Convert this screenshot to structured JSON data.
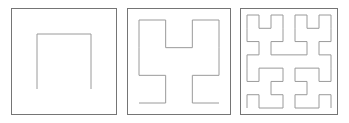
{
  "figure": {
    "background_color": "#ffffff",
    "width": 349,
    "height": 123,
    "panel_count": 3
  },
  "style": {
    "panel_border_color": "#757575",
    "panel_border_width": 1,
    "panel_fill_color": "#ffffff",
    "curve_stroke_color": "#9a9a9a",
    "curve_stroke_width": 1
  },
  "panels": [
    {
      "name": "hilbert-order-1",
      "label": "Order 1",
      "order": 1,
      "segments": 3,
      "vertices": 4,
      "x": 11,
      "y": 8,
      "width": 106,
      "height": 107,
      "curve_inset": 26,
      "orientation": "inverted-u"
    },
    {
      "name": "hilbert-order-2",
      "label": "Order 2",
      "order": 2,
      "segments": 15,
      "vertices": 16,
      "x": 127,
      "y": 8,
      "width": 104,
      "height": 107,
      "curve_inset": 12,
      "orientation": "inverted-u"
    },
    {
      "name": "hilbert-order-3",
      "label": "Order 3",
      "order": 3,
      "segments": 63,
      "vertices": 64,
      "x": 240,
      "y": 8,
      "width": 98,
      "height": 107,
      "curve_inset": 7,
      "orientation": "inverted-u"
    }
  ],
  "chart_data": {
    "type": "line",
    "xlabel": "",
    "ylabel": "",
    "grid": false,
    "legend": "none",
    "series": [
      {
        "name": "Order 1",
        "order": 1,
        "grid_size": 2,
        "point_count": 4,
        "points": [
          [
            0,
            0
          ],
          [
            0,
            1
          ],
          [
            1,
            1
          ],
          [
            1,
            0
          ]
        ]
      },
      {
        "name": "Order 2",
        "order": 2,
        "grid_size": 4,
        "point_count": 16,
        "points": [
          [
            0,
            0
          ],
          [
            1,
            0
          ],
          [
            1,
            1
          ],
          [
            0,
            1
          ],
          [
            0,
            2
          ],
          [
            0,
            3
          ],
          [
            1,
            3
          ],
          [
            1,
            2
          ],
          [
            2,
            2
          ],
          [
            2,
            3
          ],
          [
            3,
            3
          ],
          [
            3,
            2
          ],
          [
            3,
            1
          ],
          [
            2,
            1
          ],
          [
            2,
            0
          ],
          [
            3,
            0
          ]
        ]
      },
      {
        "name": "Order 3",
        "order": 3,
        "grid_size": 8,
        "point_count": 64,
        "points": [
          [
            0,
            0
          ],
          [
            0,
            1
          ],
          [
            1,
            1
          ],
          [
            1,
            0
          ],
          [
            2,
            0
          ],
          [
            3,
            0
          ],
          [
            3,
            1
          ],
          [
            2,
            1
          ],
          [
            2,
            2
          ],
          [
            3,
            2
          ],
          [
            3,
            3
          ],
          [
            2,
            3
          ],
          [
            1,
            3
          ],
          [
            1,
            2
          ],
          [
            0,
            2
          ],
          [
            0,
            3
          ],
          [
            0,
            4
          ],
          [
            1,
            4
          ],
          [
            1,
            5
          ],
          [
            0,
            5
          ],
          [
            0,
            6
          ],
          [
            0,
            7
          ],
          [
            1,
            7
          ],
          [
            1,
            6
          ],
          [
            2,
            6
          ],
          [
            2,
            7
          ],
          [
            3,
            7
          ],
          [
            3,
            6
          ],
          [
            3,
            5
          ],
          [
            2,
            5
          ],
          [
            2,
            4
          ],
          [
            3,
            4
          ],
          [
            4,
            4
          ],
          [
            5,
            4
          ],
          [
            5,
            5
          ],
          [
            4,
            5
          ],
          [
            4,
            6
          ],
          [
            4,
            7
          ],
          [
            5,
            7
          ],
          [
            5,
            6
          ],
          [
            6,
            6
          ],
          [
            6,
            7
          ],
          [
            7,
            7
          ],
          [
            7,
            6
          ],
          [
            7,
            5
          ],
          [
            6,
            5
          ],
          [
            6,
            4
          ],
          [
            7,
            4
          ],
          [
            7,
            3
          ],
          [
            7,
            2
          ],
          [
            6,
            2
          ],
          [
            6,
            3
          ],
          [
            5,
            3
          ],
          [
            4,
            3
          ],
          [
            4,
            2
          ],
          [
            5,
            2
          ],
          [
            5,
            1
          ],
          [
            4,
            1
          ],
          [
            4,
            0
          ],
          [
            5,
            0
          ],
          [
            6,
            0
          ],
          [
            6,
            1
          ],
          [
            7,
            1
          ],
          [
            7,
            0
          ]
        ]
      }
    ]
  }
}
